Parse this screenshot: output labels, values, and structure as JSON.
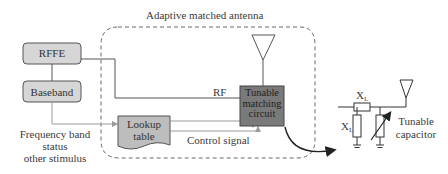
{
  "diagram": {
    "title": "Adaptive matched antenna",
    "blocks": {
      "rffe": {
        "label": "RFFE"
      },
      "baseband": {
        "label": "Baseband"
      },
      "lookup_table": {
        "line1": "Lookup",
        "line2": "table"
      },
      "tunable_matching_circuit": {
        "line1": "Tunable",
        "line2": "matching",
        "line3": "circuit"
      }
    },
    "signals": {
      "rf": "RF",
      "control": "Control signal"
    },
    "inputs": {
      "line1": "Frequency band",
      "line2": "status",
      "line3": "other stimulus"
    },
    "circuit_detail": {
      "series_inductor": {
        "symbol": "X",
        "subscript": "L"
      },
      "shunt_inductor": {
        "symbol": "X",
        "subscript": "L"
      },
      "tunable_capacitor_label_line1": "Tunable",
      "tunable_capacitor_label_line2": "capacitor"
    },
    "colors": {
      "block_fill": "#d6d6d6",
      "dark_block_fill": "#7a7a7a",
      "line": "#555555",
      "signal_line": "#9a9a9a",
      "dashed_border": "#6a6a6a"
    }
  }
}
